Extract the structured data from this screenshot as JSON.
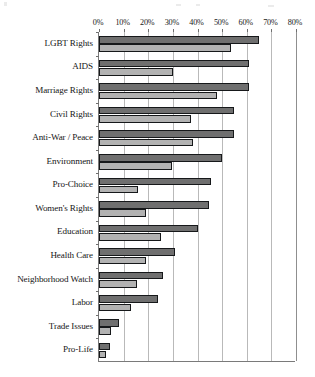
{
  "chart_data": {
    "type": "bar",
    "orientation": "horizontal",
    "title": "",
    "subtitle": "",
    "xlabel": "",
    "ylabel": "",
    "xlim": [
      0,
      80
    ],
    "xtick_labels": [
      "0%",
      "10%",
      "20%",
      "30%",
      "40%",
      "50%",
      "60%",
      "70%",
      "80%"
    ],
    "xtick_values": [
      0,
      10,
      20,
      30,
      40,
      50,
      60,
      70,
      80
    ],
    "grid": true,
    "legend": "none",
    "categories": [
      "LGBT Rights",
      "AIDS",
      "Marriage Rights",
      "Civil Rights",
      "Anti-War / Peace",
      "Environment",
      "Pro-Choice",
      "Women's Rights",
      "Education",
      "Health Care",
      "Neighborhood Watch",
      "Labor",
      "Trade Issues",
      "Pro-Life"
    ],
    "series": [
      {
        "name": "series-a",
        "color": "#6f6f6f",
        "values": [
          65,
          61,
          61,
          55,
          55,
          50,
          45.5,
          44.5,
          40,
          31,
          26,
          24,
          8,
          4.5
        ]
      },
      {
        "name": "series-b",
        "color": "#b2b2b2",
        "values": [
          53.5,
          30,
          48,
          37.5,
          38,
          29.5,
          16,
          19,
          25,
          19,
          15.5,
          13,
          5,
          3
        ]
      }
    ],
    "colors": {
      "series_a": "#6f6f6f",
      "series_b": "#b2b2b2",
      "bar_outline": "#16181a",
      "gridline": "#b9b9b9",
      "axis": "#7a7a7a",
      "text": "#161616",
      "background": "#ffffff"
    }
  }
}
